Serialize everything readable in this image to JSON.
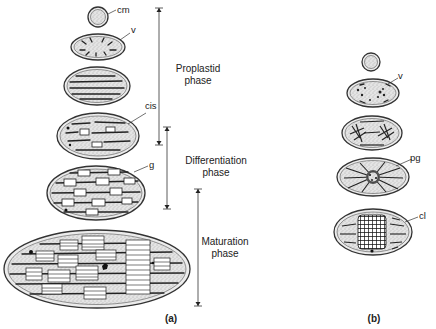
{
  "figure": {
    "panel_a": {
      "label": "(a)",
      "structure_labels": {
        "cm": "cm",
        "v": "v",
        "cis": "cis",
        "g": "g"
      },
      "phases": [
        {
          "line1": "Proplastid",
          "line2": "phase"
        },
        {
          "line1": "Differentiation",
          "line2": "phase"
        },
        {
          "line1": "Maturation",
          "line2": "phase"
        }
      ],
      "stages": [
        "proplastid-round",
        "vesicle-stage",
        "lamellae-stage",
        "cisternae-stage",
        "grana-stage",
        "mature-chloroplast"
      ]
    },
    "panel_b": {
      "label": "(b)",
      "structure_labels": {
        "v": "v",
        "pg": "pg",
        "cl": "cl"
      },
      "stages": [
        "proplastid-round",
        "vesicle-stage",
        "prolamellar-forming",
        "prolamellar-body",
        "crystalline-lattice"
      ]
    },
    "colors": {
      "ink": "#222222",
      "stipple_bg": "#e6e6e6",
      "background": "#ffffff"
    }
  }
}
